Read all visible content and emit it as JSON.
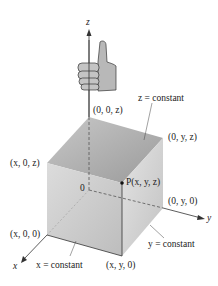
{
  "figure": {
    "axes": {
      "x": "x",
      "y": "y",
      "z": "z"
    },
    "origin_label": "0",
    "point_label": "P(x, y, z)",
    "vertex_labels": {
      "z_axis_point": "(0, 0, z)",
      "yz_point": "(0, y, z)",
      "xz_point": "(x, 0, z)",
      "y_axis_point": "(0, y, 0)",
      "x_axis_point": "(x, 0, 0)",
      "xy_point": "(x, y, 0)"
    },
    "plane_labels": {
      "z_plane": "z = constant",
      "y_plane": "y = constant",
      "x_plane": "x = constant"
    },
    "icon": "thumbs-up-hand-icon",
    "colors": {
      "top_face": "#a9a9a9",
      "left_face": "#d6d6d6",
      "right_face": "#c4c4c4",
      "lines": "#333333"
    }
  }
}
